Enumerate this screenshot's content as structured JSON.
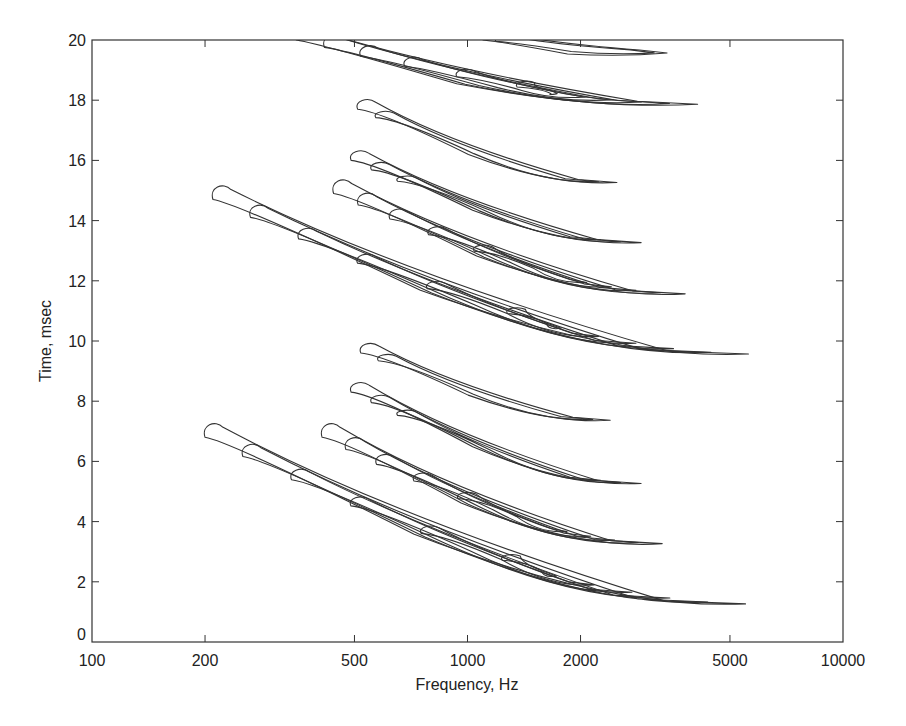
{
  "chart_data": {
    "type": "contour",
    "title": "",
    "xlabel": "Frequency, Hz",
    "ylabel": "Time, msec",
    "xscale": "log",
    "xlim": [
      100,
      10000
    ],
    "ylim": [
      0,
      20
    ],
    "xticks": [
      100,
      200,
      500,
      1000,
      2000,
      5000,
      10000
    ],
    "xtick_labels": [
      "100",
      "200",
      "500",
      "1000",
      "2000",
      "5000",
      "10000"
    ],
    "yticks": [
      0,
      2,
      4,
      6,
      8,
      10,
      12,
      14,
      16,
      18,
      20
    ],
    "ytick_labels": [
      "0",
      "2",
      "4",
      "6",
      "8",
      "10",
      "12",
      "14",
      "16",
      "18",
      "20"
    ],
    "grid": false,
    "legend": null,
    "bands": [
      {
        "name": "band-1",
        "f_start_hz": 200,
        "f_end_hz": 5500,
        "t_start_ms": 6.8,
        "t_end_ms": 1.3,
        "levels": 6
      },
      {
        "name": "band-2",
        "f_start_hz": 410,
        "f_end_hz": 3300,
        "t_start_ms": 6.8,
        "t_end_ms": 3.3,
        "levels": 5
      },
      {
        "name": "band-3",
        "f_start_hz": 490,
        "f_end_hz": 2900,
        "t_start_ms": 8.3,
        "t_end_ms": 5.3,
        "levels": 3
      },
      {
        "name": "band-4",
        "f_start_hz": 520,
        "f_end_hz": 2400,
        "t_start_ms": 9.6,
        "t_end_ms": 7.4,
        "levels": 2
      },
      {
        "name": "band-5",
        "f_start_hz": 210,
        "f_end_hz": 5600,
        "t_start_ms": 14.7,
        "t_end_ms": 9.6,
        "levels": 6
      },
      {
        "name": "band-6",
        "f_start_hz": 440,
        "f_end_hz": 3800,
        "t_start_ms": 14.9,
        "t_end_ms": 11.6,
        "levels": 5
      },
      {
        "name": "band-7",
        "f_start_hz": 490,
        "f_end_hz": 2900,
        "t_start_ms": 16.0,
        "t_end_ms": 13.3,
        "levels": 3
      },
      {
        "name": "band-8",
        "f_start_hz": 510,
        "f_end_hz": 2500,
        "t_start_ms": 17.7,
        "t_end_ms": 15.3,
        "levels": 2
      },
      {
        "name": "band-9",
        "f_start_hz": 350,
        "f_end_hz": 4100,
        "t_start_ms": 20.0,
        "t_end_ms": 17.9,
        "levels": 6
      },
      {
        "name": "band-10",
        "f_start_hz": 1100,
        "f_end_hz": 3400,
        "t_start_ms": 20.0,
        "t_end_ms": 19.6,
        "levels": 2
      }
    ]
  },
  "plot": {
    "left": 92,
    "right": 843,
    "top": 40,
    "bottom": 642
  }
}
